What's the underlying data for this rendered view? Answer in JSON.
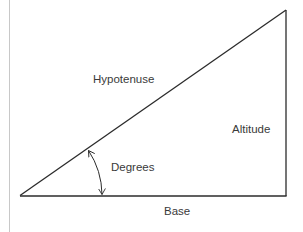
{
  "diagram": {
    "type": "right-triangle",
    "labels": {
      "hypotenuse": "Hypotenuse",
      "altitude": "Altitude",
      "degrees": "Degrees",
      "base": "Base"
    },
    "colors": {
      "stroke": "#2b2b2b",
      "text": "#3a3a3a",
      "margin_line": "#c8c8c8",
      "background": "#ffffff"
    }
  }
}
